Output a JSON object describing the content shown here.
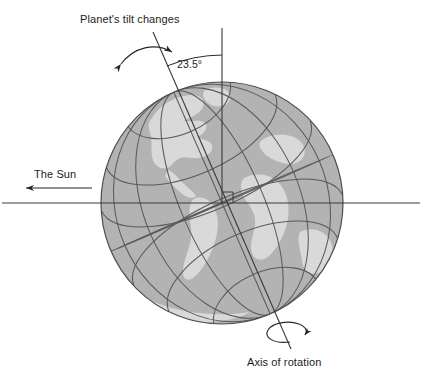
{
  "figure": {
    "type": "astronomy-diagram",
    "background_color": "#ffffff"
  },
  "labels": {
    "tilt_changes": "Planet's tilt changes",
    "tilt_angle": "23.5°",
    "sun": "The Sun",
    "axis_of_rotation": "Axis of rotation"
  },
  "colors": {
    "ocean": "#b3b3b3",
    "land": "#d9d9d9",
    "outline": "#4d4d4d",
    "graticule": "#5a5a5a",
    "line": "#3a3a3a",
    "text": "#1c1c1c"
  },
  "geometry": {
    "globe_center_x": 222,
    "globe_center_y": 203,
    "globe_radius": 121,
    "tilt_degrees": 23.5,
    "vertical_reference_top_y": 28,
    "orbital_plane_y": 203,
    "orbital_plane_x_start": 2,
    "orbital_plane_x_end": 420
  },
  "annotations": {
    "sun_arrow_direction": "left",
    "tilt_arrow_type": "double-headed-curved",
    "rotation_arrow_type": "circular-loop-counterclockwise",
    "right_angle_marker": true
  }
}
